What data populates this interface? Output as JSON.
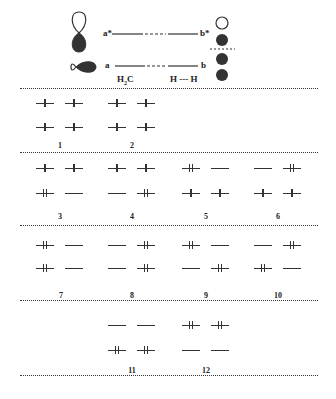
{
  "header": {
    "orbital_labels": {
      "a_star": "a*",
      "b_star": "b*",
      "a": "a",
      "b": "b"
    },
    "fragment_labels": {
      "left": "H2C",
      "right": "H --- H"
    },
    "icons": [
      "p-orbital-vertical-icon",
      "sp-orbital-horizontal-icon",
      "empty-circle-icon",
      "filled-circle-icon"
    ]
  },
  "configurations": [
    {
      "id": "1",
      "upper": [
        "single",
        "single"
      ],
      "lower": [
        "single",
        "single"
      ]
    },
    {
      "id": "2",
      "upper": [
        "single",
        "single"
      ],
      "lower": [
        "single",
        "single"
      ]
    },
    {
      "id": "3",
      "upper": [
        "single",
        "single"
      ],
      "lower": [
        "double",
        "empty"
      ]
    },
    {
      "id": "4",
      "upper": [
        "single",
        "single"
      ],
      "lower": [
        "empty",
        "double"
      ]
    },
    {
      "id": "5",
      "upper": [
        "double",
        "empty"
      ],
      "lower": [
        "single",
        "single"
      ]
    },
    {
      "id": "6",
      "upper": [
        "empty",
        "double"
      ],
      "lower": [
        "single",
        "single"
      ]
    },
    {
      "id": "7",
      "upper": [
        "double",
        "empty"
      ],
      "lower": [
        "double",
        "empty"
      ]
    },
    {
      "id": "8",
      "upper": [
        "empty",
        "double"
      ],
      "lower": [
        "empty",
        "double"
      ]
    },
    {
      "id": "9",
      "upper": [
        "double",
        "empty"
      ],
      "lower": [
        "empty",
        "double"
      ]
    },
    {
      "id": "10",
      "upper": [
        "empty",
        "double"
      ],
      "lower": [
        "double",
        "empty"
      ]
    },
    {
      "id": "11",
      "upper": [
        "empty",
        "empty"
      ],
      "lower": [
        "double",
        "double"
      ]
    },
    {
      "id": "12",
      "upper": [
        "double",
        "double"
      ],
      "lower": [
        "empty",
        "empty"
      ]
    }
  ],
  "labels": {
    "c1": "1",
    "c2": "2",
    "c3": "3",
    "c4": "4",
    "c5": "5",
    "c6": "6",
    "c7": "7",
    "c8": "8",
    "c9": "9",
    "c10": "10",
    "c11": "11",
    "c12": "12"
  }
}
